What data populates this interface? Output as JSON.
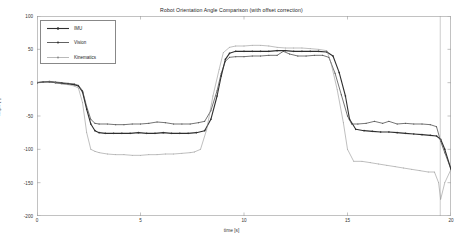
{
  "chart_data": {
    "type": "line",
    "title": "Robot Orientation Angle Comparison (with offset correction)",
    "xlabel": "time [s]",
    "ylabel": "angle [°]",
    "xlim": [
      0,
      20
    ],
    "ylim": [
      -200,
      100
    ],
    "xticks": [
      0,
      5,
      10,
      15,
      20
    ],
    "yticks": [
      100,
      50,
      0,
      -50,
      -100,
      -150,
      -200
    ],
    "grid": false,
    "legend_position": "upper left",
    "series": [
      {
        "name": "IMU",
        "color": "#2f2f2f",
        "marker": "dot",
        "linewidth": 1.1,
        "x": [
          0.0,
          0.3,
          0.6,
          0.9,
          1.2,
          1.5,
          1.8,
          2.0,
          2.2,
          2.4,
          2.6,
          2.8,
          3.0,
          3.3,
          3.7,
          4.1,
          4.5,
          4.9,
          5.3,
          5.7,
          6.1,
          6.5,
          6.9,
          7.3,
          7.7,
          8.1,
          8.4,
          8.7,
          8.9,
          9.1,
          9.3,
          9.6,
          10.0,
          10.4,
          10.8,
          11.2,
          11.6,
          12.0,
          12.4,
          12.8,
          13.2,
          13.6,
          14.0,
          14.3,
          14.6,
          14.9,
          15.1,
          15.4,
          15.8,
          16.2,
          16.6,
          17.0,
          17.4,
          17.8,
          18.2,
          18.6,
          19.0,
          19.3,
          19.5,
          19.7,
          20.0
        ],
        "y": [
          0,
          1,
          1,
          0,
          -1,
          -2,
          -3,
          -5,
          -14,
          -40,
          -62,
          -72,
          -75,
          -76,
          -76,
          -76,
          -76,
          -75,
          -76,
          -76,
          -75,
          -76,
          -76,
          -76,
          -75,
          -72,
          -55,
          -20,
          10,
          35,
          44,
          47,
          47,
          47,
          47,
          47,
          48,
          48,
          47,
          47,
          47,
          47,
          46,
          40,
          15,
          -20,
          -55,
          -70,
          -72,
          -73,
          -74,
          -74,
          -75,
          -76,
          -77,
          -78,
          -79,
          -80,
          -85,
          -100,
          -130
        ]
      },
      {
        "name": "Vision",
        "color": "#3a3a3a",
        "marker": "dot",
        "linewidth": 0.7,
        "x": [
          0.0,
          0.3,
          0.6,
          0.9,
          1.2,
          1.5,
          1.8,
          2.0,
          2.2,
          2.4,
          2.6,
          2.8,
          3.0,
          3.4,
          3.8,
          4.2,
          4.6,
          5.0,
          5.4,
          5.8,
          6.2,
          6.6,
          7.0,
          7.4,
          7.8,
          8.1,
          8.4,
          8.7,
          8.9,
          9.1,
          9.3,
          9.6,
          10.0,
          10.4,
          10.8,
          11.2,
          11.6,
          11.9,
          12.2,
          12.6,
          13.0,
          13.4,
          13.8,
          14.1,
          14.4,
          14.7,
          15.0,
          15.2,
          15.5,
          15.9,
          16.3,
          16.7,
          17.0,
          17.4,
          17.8,
          18.2,
          18.6,
          19.0,
          19.3,
          19.5,
          19.7,
          20.0
        ],
        "y": [
          0,
          1,
          2,
          1,
          0,
          -1,
          -2,
          -4,
          -12,
          -36,
          -55,
          -61,
          -62,
          -62,
          -63,
          -63,
          -62,
          -62,
          -61,
          -59,
          -60,
          -62,
          -62,
          -62,
          -60,
          -58,
          -42,
          -12,
          14,
          32,
          38,
          39,
          39,
          40,
          40,
          41,
          41,
          47,
          43,
          40,
          40,
          41,
          41,
          38,
          14,
          -18,
          -50,
          -62,
          -62,
          -61,
          -58,
          -61,
          -58,
          -62,
          -61,
          -62,
          -62,
          -63,
          -66,
          -88,
          -105,
          -130
        ]
      },
      {
        "name": "Kinematics",
        "color": "#8a8a8a",
        "marker": "dot",
        "linewidth": 0.55,
        "x": [
          0.0,
          0.3,
          0.6,
          0.9,
          1.2,
          1.5,
          1.8,
          2.0,
          2.2,
          2.4,
          2.6,
          2.8,
          3.0,
          3.4,
          3.8,
          4.2,
          4.6,
          5.0,
          5.4,
          5.8,
          6.2,
          6.6,
          7.0,
          7.4,
          7.6,
          7.9,
          8.2,
          8.5,
          8.8,
          9.0,
          9.3,
          9.6,
          10.0,
          10.4,
          10.8,
          11.2,
          11.6,
          12.0,
          12.4,
          12.8,
          13.2,
          13.6,
          14.0,
          14.2,
          14.5,
          14.8,
          15.0,
          15.3,
          15.7,
          16.1,
          16.5,
          16.9,
          17.3,
          17.7,
          18.1,
          18.5,
          18.9,
          19.2,
          19.4,
          19.5,
          19.7,
          20.0
        ],
        "y": [
          0,
          1,
          1,
          0,
          -2,
          -3,
          -5,
          -8,
          -30,
          -75,
          -100,
          -103,
          -105,
          -107,
          -108,
          -108,
          -109,
          -109,
          -108,
          -108,
          -107,
          -107,
          -106,
          -105,
          -104,
          -100,
          -70,
          -20,
          20,
          45,
          53,
          55,
          55,
          56,
          56,
          55,
          53,
          52,
          52,
          52,
          51,
          50,
          48,
          30,
          -10,
          -60,
          -100,
          -118,
          -118,
          -120,
          -122,
          -124,
          -126,
          -128,
          -130,
          -132,
          -134,
          -134,
          -150,
          -175,
          -150,
          -130
        ]
      }
    ],
    "annotations": [
      {
        "name": "spike-artifact",
        "x": 19.48,
        "description": "near-vertical transient line spanning full vertical range"
      }
    ]
  },
  "legend": {
    "items": [
      {
        "label": "IMU"
      },
      {
        "label": "Vision"
      },
      {
        "label": "Kinematics"
      }
    ]
  }
}
